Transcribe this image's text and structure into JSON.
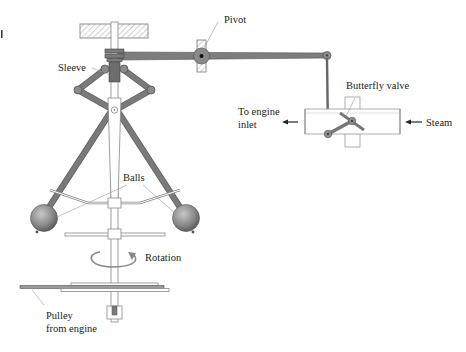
{
  "diagram": {
    "labels": {
      "pivot": "Pivot",
      "sleeve": "Sleeve",
      "butterfly_valve": "Butterfly valve",
      "to_engine_line1": "To engine",
      "to_engine_line2": "inlet",
      "steam": "Steam",
      "balls": "Balls",
      "rotation": "Rotation",
      "pulley_line1": "Pulley",
      "pulley_line2": "from engine"
    },
    "components": [
      "fixed-support",
      "vertical-spindle",
      "sleeve",
      "linkage-arms",
      "flyballs",
      "lever-arm",
      "pivot",
      "connecting-rod",
      "butterfly-valve",
      "steam-pipe",
      "pulley",
      "bearing-base"
    ],
    "flows": [
      {
        "label": "Steam",
        "direction": "left",
        "from": "right"
      },
      {
        "label": "To engine inlet",
        "direction": "left",
        "to": "left"
      }
    ],
    "colors": {
      "metal": "#7a7a7a",
      "metal_dark": "#555555",
      "ball": "#8c8c8c",
      "outline": "#888888",
      "text": "#222222",
      "background": "#ffffff"
    }
  }
}
